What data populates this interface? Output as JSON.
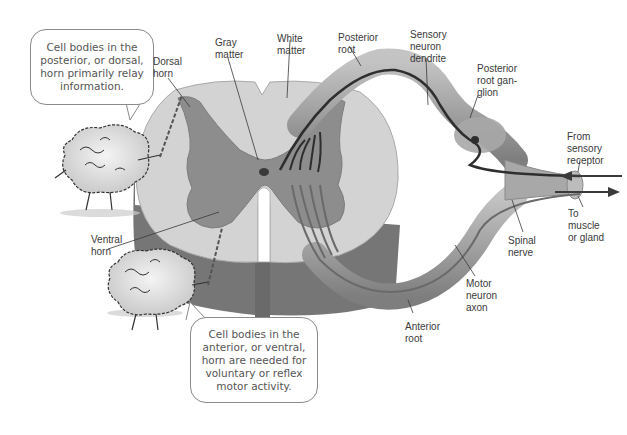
{
  "diagram": {
    "colors": {
      "gray_matter": "#8e8e8e",
      "white_matter": "#d2d2d2",
      "cord_side": "#7a7a7a",
      "nerve": "#9c9c9c",
      "neuron_line": "#2e2e2e",
      "text": "#3a3a3a"
    },
    "labels": {
      "dorsal_horn": "Dorsal\nhorn",
      "gray_matter": "Gray\nmatter",
      "white_matter": "White\nmatter",
      "posterior_root": "Posterior\nroot",
      "sensory_neuron_dendrite": "Sensory\nneuron\ndendrite",
      "posterior_root_ganglion": "Posterior\nroot gan-\nglion",
      "from_sensory_receptor": "From\nsensory\nreceptor",
      "to_muscle_or_gland": "To\nmuscle\nor gland",
      "spinal_nerve": "Spinal\nnerve",
      "motor_neuron_axon": "Motor\nneuron\naxon",
      "anterior_root": "Anterior\nroot",
      "ventral_horn": "Ventral\nhorn"
    },
    "callouts": {
      "dorsal": "Cell bodies in the\nposterior, or dorsal,\nhorn primarily relay\ninformation.",
      "ventral": "Cell bodies in the\nanterior, or ventral,\nhorn are needed for\nvoluntary or reflex\nmotor activity."
    },
    "arrows": {
      "incoming": "left-arrow",
      "outgoing": "right-arrow"
    }
  }
}
